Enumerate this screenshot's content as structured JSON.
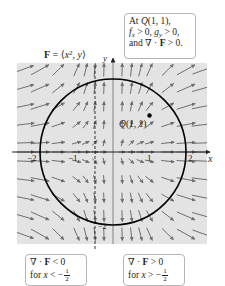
{
  "field": {
    "label_prefix": "F",
    "label_equals": " = ⟨",
    "label_x": "x",
    "label_exp": "2",
    "label_rest": ", ",
    "label_y": "y",
    "label_close": "⟩",
    "full_text": "F = ⟨x², y⟩"
  },
  "axes": {
    "x_label": "x",
    "y_label": "y",
    "x_ticks": [
      {
        "value": -2,
        "label": "−2"
      },
      {
        "value": -1,
        "label": "−1"
      },
      {
        "value": 1,
        "label": "1"
      },
      {
        "value": 2,
        "label": "2"
      }
    ],
    "y_ticks": [
      {
        "value": -2,
        "label": "−2"
      }
    ],
    "y_tick_label_neg2": "−2"
  },
  "circle": {
    "center": [
      0,
      0
    ],
    "radius": 2
  },
  "dashed_line": {
    "x": -0.5
  },
  "point": {
    "name": "Q",
    "label": "Q(1, 1)",
    "label_prefix": "Q",
    "label_coords": "(1, 1)",
    "x": 1,
    "y": 1
  },
  "callouts": {
    "top": {
      "line1_prefix": "At ",
      "line1_point": "Q",
      "line1_rest": "(1, 1),",
      "line2_f": "f",
      "line2_fsub": "x",
      "line2_mid": " > 0, ",
      "line2_g": "g",
      "line2_gsub": "y",
      "line2_end": " > 0,",
      "line3_prefix": "and ∇ · ",
      "line3_F": "F",
      "line3_end": " > 0.",
      "full_text": "At Q(1, 1), fx > 0, gy > 0, and ∇ · F > 0."
    },
    "bottom_left": {
      "line1_prefix": "∇ · ",
      "line1_F": "F",
      "line1_end": " < 0",
      "line2_prefix": "for ",
      "line2_x": "x",
      "line2_op": " < −",
      "frac_num": "1",
      "frac_den": "2",
      "full_text": "∇ · F < 0 for x < −1/2"
    },
    "bottom_right": {
      "line1_prefix": "∇ · ",
      "line1_F": "F",
      "line1_end": " > 0",
      "line2_prefix": "for ",
      "line2_x": "x",
      "line2_op": " > −",
      "frac_num": "1",
      "frac_den": "2",
      "full_text": "∇ · F > 0 for x > −1/2"
    }
  },
  "colors": {
    "plot_background": "#e3e3e4",
    "arrow": "#6d6e70",
    "axis": "#231f20",
    "y_axis": "#808285",
    "circle": "#000000",
    "callout_border": "#b5b5b5"
  }
}
